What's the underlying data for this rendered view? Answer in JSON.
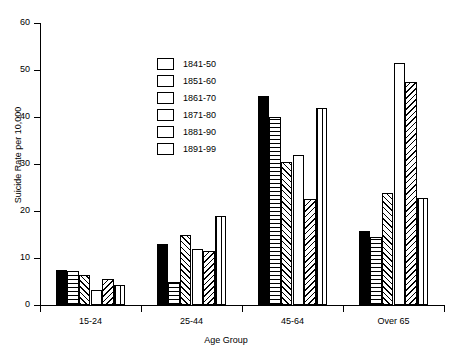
{
  "chart_data": {
    "type": "bar",
    "title": "",
    "xlabel": "Age Group",
    "ylabel": "Suicide Rate per 10,000",
    "categories": [
      "15-24",
      "25-44",
      "45-64",
      "Over 65"
    ],
    "ylim": [
      0,
      60
    ],
    "yticks": [
      0,
      10,
      20,
      30,
      40,
      50,
      60
    ],
    "grid": false,
    "legend_position": "upper-left-inside",
    "series": [
      {
        "name": "1841-50",
        "pattern": "solid-black",
        "values": [
          7.5,
          13.0,
          44.5,
          15.8
        ]
      },
      {
        "name": "1851-60",
        "pattern": "horizontal-lines",
        "values": [
          7.3,
          5.0,
          40.0,
          14.5
        ]
      },
      {
        "name": "1861-70",
        "pattern": "diagonal-up",
        "values": [
          6.3,
          15.0,
          30.5,
          23.8
        ]
      },
      {
        "name": "1871-80",
        "pattern": "blank-white",
        "values": [
          3.2,
          12.0,
          32.0,
          51.5
        ]
      },
      {
        "name": "1881-90",
        "pattern": "diagonal-down",
        "values": [
          5.6,
          11.5,
          22.5,
          47.5
        ]
      },
      {
        "name": "1891-99",
        "pattern": "vertical-lines",
        "values": [
          4.2,
          19.0,
          42.0,
          22.8
        ]
      }
    ]
  },
  "legend": {
    "entries": [
      {
        "label": "1841-50"
      },
      {
        "label": "1851-60"
      },
      {
        "label": "1861-70"
      },
      {
        "label": "1871-80"
      },
      {
        "label": "1881-90"
      },
      {
        "label": "1891-99"
      }
    ]
  }
}
